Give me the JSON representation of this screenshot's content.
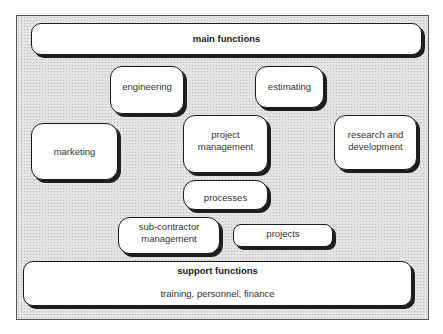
{
  "diagram": {
    "main": {
      "label": "main functions"
    },
    "boxes": {
      "engineering": "engineering",
      "estimating": "estimating",
      "marketing": "marketing",
      "project_management": [
        "project",
        "management"
      ],
      "research_development": [
        "research and",
        "development"
      ],
      "processes": "processes",
      "sub_contractor": [
        "sub-contractor",
        "management"
      ],
      "projects": "projects"
    },
    "support": {
      "label": "support functions",
      "detail": "training, personnel, finance"
    }
  }
}
